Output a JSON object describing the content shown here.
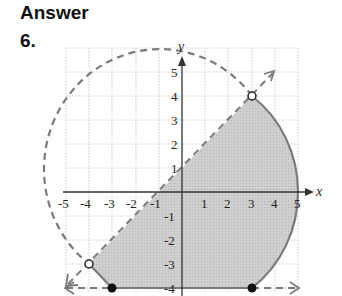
{
  "header": {
    "title": "Answer",
    "problem_number": "6."
  },
  "graph": {
    "x_label": "x",
    "y_label": "y",
    "x_ticks": [
      "-5",
      "-4",
      "-3",
      "-2",
      "-1",
      "1",
      "2",
      "3",
      "4",
      "5"
    ],
    "y_ticks": [
      "5",
      "4",
      "3",
      "2",
      "1",
      "-1",
      "-2",
      "-3",
      "-4"
    ],
    "colors": {
      "shade": "#c8c8c8",
      "boundary": "#7a7a7a",
      "grid": "#bdbdbd",
      "axis": "#333333"
    },
    "boundaries": [
      {
        "type": "circle",
        "equation": "x^2 + y^2 = 25",
        "style": "dashed/solid"
      },
      {
        "type": "line",
        "equation": "y = x + 1",
        "style": "dashed"
      },
      {
        "type": "line",
        "equation": "y = -4",
        "style": "solid/dashed"
      }
    ],
    "points": [
      {
        "x": 3,
        "y": 4,
        "filled": false
      },
      {
        "x": -4,
        "y": -3,
        "filled": false
      },
      {
        "x": -3,
        "y": -4,
        "filled": true
      },
      {
        "x": 3,
        "y": -4,
        "filled": true
      }
    ]
  }
}
